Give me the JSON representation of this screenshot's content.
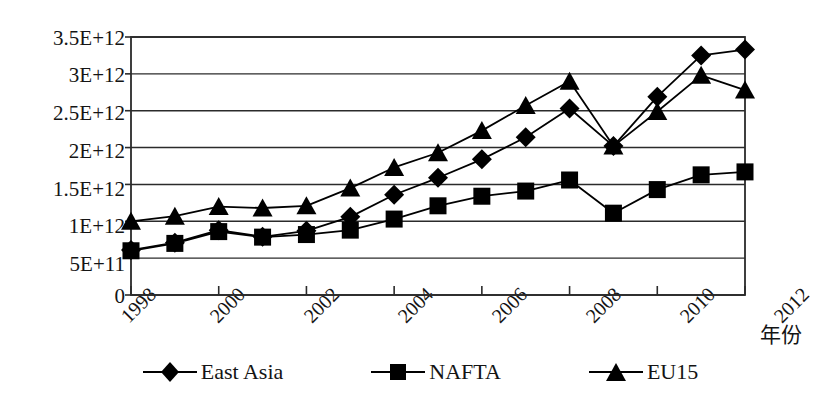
{
  "chart_data": {
    "type": "line",
    "title": "",
    "xlabel": "年份",
    "ylabel": "",
    "x": [
      1998,
      1999,
      2000,
      2001,
      2002,
      2003,
      2004,
      2005,
      2006,
      2007,
      2008,
      2009,
      2010,
      2011,
      2012
    ],
    "x_tick_labels": [
      "1998",
      "2000",
      "2002",
      "2004",
      "2006",
      "2008",
      "2010",
      "2012"
    ],
    "x_tick_values": [
      1998,
      2000,
      2002,
      2004,
      2006,
      2008,
      2010,
      2012
    ],
    "xlim": [
      1998,
      2012
    ],
    "ylim": [
      0,
      3500000000000.0
    ],
    "y_tick_labels": [
      "0",
      "5E+11",
      "1E+12",
      "1.5E+12",
      "2E+12",
      "2.5E+12",
      "3E+12",
      "3.5E+12"
    ],
    "y_tick_values": [
      0,
      500000000000,
      1000000000000,
      1500000000000,
      2000000000000,
      2500000000000,
      3000000000000,
      3500000000000
    ],
    "grid": true,
    "legend_position": "bottom",
    "series": [
      {
        "name": "East Asia",
        "marker": "diamond",
        "color": "#000000",
        "values": [
          610000000000.0,
          710000000000.0,
          880000000000.0,
          790000000000.0,
          870000000000.0,
          1060000000000.0,
          1360000000000.0,
          1590000000000.0,
          1840000000000.0,
          2140000000000.0,
          2530000000000.0,
          2020000000000.0,
          2690000000000.0,
          3250000000000.0,
          3330000000000.0
        ]
      },
      {
        "name": "NAFTA",
        "marker": "square",
        "color": "#000000",
        "values": [
          600000000000.0,
          700000000000.0,
          860000000000.0,
          785000000000.0,
          820000000000.0,
          880000000000.0,
          1030000000000.0,
          1210000000000.0,
          1340000000000.0,
          1410000000000.0,
          1560000000000.0,
          1110000000000.0,
          1430000000000.0,
          1630000000000.0,
          1670000000000.0
        ]
      },
      {
        "name": "EU15",
        "marker": "triangle",
        "color": "#000000",
        "values": [
          1000000000000.0,
          1070000000000.0,
          1200000000000.0,
          1180000000000.0,
          1210000000000.0,
          1450000000000.0,
          1730000000000.0,
          1930000000000.0,
          2230000000000.0,
          2570000000000.0,
          2900000000000.0,
          2020000000000.0,
          2490000000000.0,
          2980000000000.0,
          2780000000000.0
        ]
      }
    ]
  },
  "legend": {
    "items": [
      {
        "label": "East Asia",
        "marker": "diamond"
      },
      {
        "label": "NAFTA",
        "marker": "square"
      },
      {
        "label": "EU15",
        "marker": "triangle"
      }
    ]
  }
}
